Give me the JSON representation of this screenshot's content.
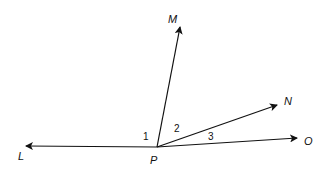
{
  "diagram": {
    "vertex": {
      "label": "P",
      "x": 157,
      "y": 147
    },
    "rays": [
      {
        "name": "PL",
        "label": "L",
        "tip": {
          "x": 26,
          "y": 146
        },
        "label_pos": {
          "x": 18,
          "y": 160
        }
      },
      {
        "name": "PM",
        "label": "M",
        "tip": {
          "x": 180,
          "y": 27
        },
        "label_pos": {
          "x": 168,
          "y": 23
        }
      },
      {
        "name": "PN",
        "label": "N",
        "tip": {
          "x": 277,
          "y": 105
        },
        "label_pos": {
          "x": 284,
          "y": 105
        }
      },
      {
        "name": "PO",
        "label": "O",
        "tip": {
          "x": 297,
          "y": 138
        },
        "label_pos": {
          "x": 304,
          "y": 145
        }
      }
    ],
    "angles": [
      {
        "label": "1",
        "x": 143,
        "y": 140
      },
      {
        "label": "2",
        "x": 174,
        "y": 132
      },
      {
        "label": "3",
        "x": 208,
        "y": 140
      }
    ],
    "stroke_color": "#111111"
  }
}
